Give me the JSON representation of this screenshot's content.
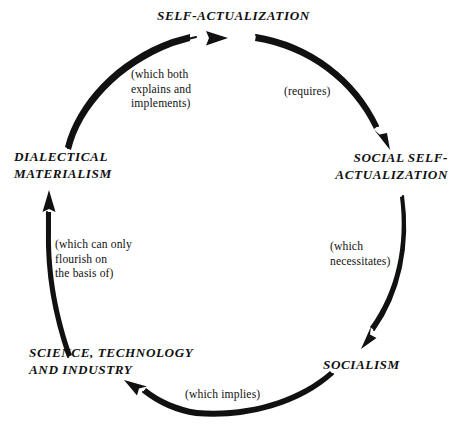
{
  "diagram": {
    "type": "cycle-diagram",
    "title_text": "",
    "stroke_color": "#111111",
    "background_color": "#ffffff",
    "nodes": [
      {
        "id": "self-actualization",
        "label": "SELF-ACTUALIZATION",
        "position": "top"
      },
      {
        "id": "social-self-actualization",
        "label": "SOCIAL SELF-\nACTUALIZATION",
        "position": "right"
      },
      {
        "id": "socialism",
        "label": "SOCIALISM",
        "position": "bottom-right"
      },
      {
        "id": "science-technology-industry",
        "label": "SCIENCE, TECHNOLOGY\nAND INDUSTRY",
        "position": "bottom-left"
      },
      {
        "id": "dialectical-materialism",
        "label": "DIALECTICAL\nMATERIALISM",
        "position": "left"
      }
    ],
    "edges": [
      {
        "id": "edge-requires",
        "from": "self-actualization",
        "to": "social-self-actualization",
        "label": "(requires)"
      },
      {
        "id": "edge-necessitates",
        "from": "social-self-actualization",
        "to": "socialism",
        "label": "(which\nnecessitates)"
      },
      {
        "id": "edge-implies",
        "from": "socialism",
        "to": "science-technology-industry",
        "label": "(which implies)"
      },
      {
        "id": "edge-flourish",
        "from": "science-technology-industry",
        "to": "dialectical-materialism",
        "label": "(which can only\nflourish on\nthe basis of)"
      },
      {
        "id": "edge-explains",
        "from": "dialectical-materialism",
        "to": "self-actualization",
        "label": "(which both\nexplains and\nimplements)"
      }
    ]
  }
}
